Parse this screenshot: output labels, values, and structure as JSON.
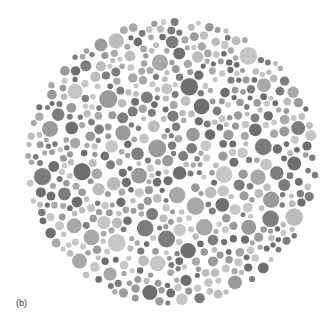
{
  "figure": {
    "panel_label": "(b)"
  },
  "plate": {
    "center_x": 172,
    "center_y": 162,
    "radius_x": 147,
    "radius_y": 144,
    "background": "#ffffff",
    "dot_tones": [
      "#6e6e6e",
      "#7d7d7d",
      "#9a9a9a",
      "#a8a8a8",
      "#bcbcbc",
      "#c6c6c6"
    ],
    "dot_radius_min": 2.5,
    "dot_radius_max": 9,
    "seed": 7
  }
}
